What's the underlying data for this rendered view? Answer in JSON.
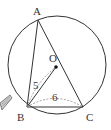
{
  "diagram": {
    "type": "geometry-circumscribed-triangle",
    "circle": {
      "cx": 57,
      "cy": 65,
      "r": 49
    },
    "points": {
      "A": {
        "label": "A",
        "x": 38,
        "y": 20,
        "lx": 33,
        "ly": 15
      },
      "B": {
        "label": "B",
        "x": 27,
        "y": 107,
        "lx": 17,
        "ly": 121
      },
      "C": {
        "label": "C",
        "x": 83,
        "y": 107,
        "lx": 86,
        "ly": 121
      },
      "O": {
        "label": "O",
        "x": 56,
        "y": 67,
        "lx": 49,
        "ly": 62
      }
    },
    "segments": [
      {
        "from": "A",
        "to": "B",
        "style": "solid"
      },
      {
        "from": "A",
        "to": "C",
        "style": "solid"
      },
      {
        "from": "B",
        "to": "C",
        "style": "solid"
      },
      {
        "from": "B",
        "to": "O",
        "style": "solid"
      },
      {
        "from": "B",
        "to": "O",
        "style": "dashed-offset",
        "note": "dimension line for length 5"
      }
    ],
    "measurements": [
      {
        "label": "5",
        "segment": "BO",
        "x": 33,
        "y": 89
      },
      {
        "label": "6",
        "segment": "BC",
        "x": 52,
        "y": 101
      }
    ],
    "colors": {
      "stroke": "#333333",
      "dashed": "#888888",
      "background": "#ffffff"
    },
    "decoration": {
      "icon": "pencil-icon"
    }
  }
}
